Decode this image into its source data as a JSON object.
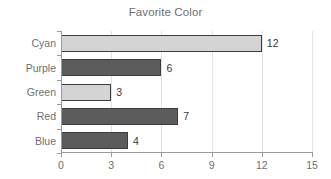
{
  "chart_data": {
    "type": "bar",
    "orientation": "horizontal",
    "title": "Favorite Color",
    "xlabel": "",
    "ylabel": "",
    "categories": [
      "Cyan",
      "Purple",
      "Green",
      "Red",
      "Blue"
    ],
    "values": [
      12,
      6,
      3,
      7,
      4
    ],
    "bar_styles": [
      "light",
      "dark",
      "light",
      "dark",
      "dark"
    ],
    "data_labels": [
      "12",
      "6",
      "3",
      "7",
      "4"
    ],
    "xlim": [
      0,
      15
    ],
    "xticks": [
      0,
      3,
      6,
      9,
      12,
      15
    ],
    "xtick_labels": [
      "0",
      "3",
      "6",
      "9",
      "12",
      "15"
    ],
    "grid": true,
    "grid_axis": "x",
    "legend": false,
    "colors": {
      "background": "#ffffff",
      "title_text": "#6e6e6e",
      "tick_text": "#707070",
      "value_text": "#3a3a3a",
      "axis_line": "#9a9a9a",
      "gridline": "#e2e2e2",
      "bar_light_fill": "#d4d4d4",
      "bar_dark_fill": "#5c5c5c",
      "bar_edge": "#3c3c3c"
    }
  }
}
